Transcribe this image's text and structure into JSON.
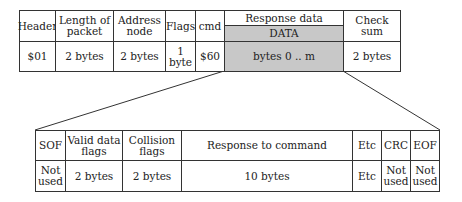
{
  "top_table": {
    "columns": [
      {
        "header": "Header",
        "value": "$01"
      },
      {
        "header": "Length of packet",
        "value": "2 bytes"
      },
      {
        "header": "Address node",
        "value": "2 bytes"
      },
      {
        "header": "Flags",
        "value": "1 byte"
      },
      {
        "header": "cmd",
        "value": "$60"
      },
      {
        "header": "Response data",
        "subheader": "DATA",
        "value": "bytes 0 .. m"
      },
      {
        "header": "Check sum",
        "value": "2 bytes"
      }
    ]
  },
  "bottom_table": {
    "columns": [
      {
        "header": "SOF",
        "value": "Not used"
      },
      {
        "header": "Valid data flags",
        "value": "2 bytes"
      },
      {
        "header": "Collision flags",
        "value": "2 bytes"
      },
      {
        "header": "Response to command",
        "value": "10 bytes"
      },
      {
        "header": "Etc",
        "value": "Etc"
      },
      {
        "header": "CRC",
        "value": "Not used"
      },
      {
        "header": "EOF",
        "value": "Not used"
      }
    ]
  },
  "colors": {
    "shade": "#c8c8c8",
    "line": "#333333"
  }
}
